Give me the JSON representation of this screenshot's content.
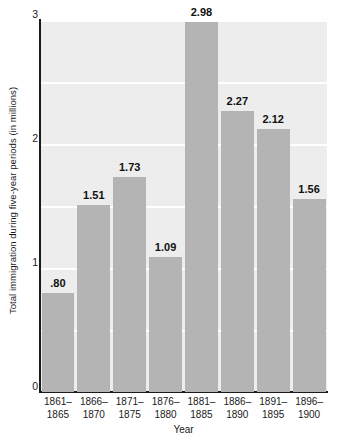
{
  "chart_data": {
    "type": "bar",
    "title": "",
    "subtitle": "",
    "xlabel": "Year",
    "ylabel": "Total immigration during five-year periods (in millions)",
    "categories": [
      "1861–1865",
      "1866–1870",
      "1871–1875",
      "1876–1880",
      "1881–1885",
      "1886–1890",
      "1891–1895",
      "1896–1900"
    ],
    "category_lines": [
      [
        "1861–",
        "1865"
      ],
      [
        "1866–",
        "1870"
      ],
      [
        "1871–",
        "1875"
      ],
      [
        "1876–",
        "1880"
      ],
      [
        "1881–",
        "1885"
      ],
      [
        "1886–",
        "1890"
      ],
      [
        "1891–",
        "1895"
      ],
      [
        "1896–",
        "1900"
      ]
    ],
    "values": [
      0.8,
      1.51,
      1.73,
      1.09,
      2.98,
      2.27,
      2.12,
      1.56
    ],
    "value_labels": [
      ".80",
      "1.51",
      "1.73",
      "1.09",
      "2.98",
      "2.27",
      "2.12",
      "1.56"
    ],
    "ylim": [
      0,
      3
    ],
    "xlim": [
      0,
      8
    ],
    "y_ticks": [
      0,
      1,
      2,
      3
    ],
    "y_tick_labels": [
      "0",
      "1",
      "2",
      "3"
    ],
    "gridlines": [
      0.5,
      1.0,
      1.5,
      2.0,
      2.5,
      3.0
    ],
    "grid": true,
    "grid_orientation": "horizontal",
    "legend": false,
    "legend_position": "none",
    "colors": {
      "bar": "#b4b4b4",
      "plot_background": "#ededed",
      "page_background": "#ffffff",
      "gridline": "#ffffff",
      "axis": "#1a1a1a",
      "text": "#1a1a1a"
    }
  }
}
